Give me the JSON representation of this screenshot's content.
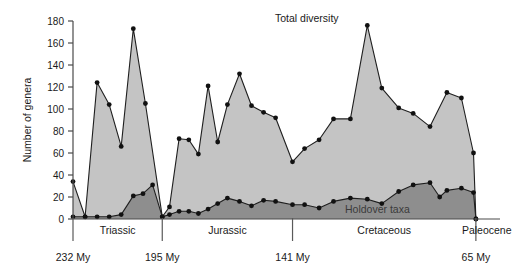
{
  "chart_data": {
    "type": "area",
    "title": "",
    "xlabel": "",
    "ylabel": "Number of genera",
    "ylim": [
      0,
      180
    ],
    "yticks": [
      0,
      20,
      40,
      60,
      80,
      100,
      120,
      140,
      160,
      180
    ],
    "grid": false,
    "legend_position": "inline-annotation",
    "xlim_my": [
      232,
      55
    ],
    "x_axis_unit": "My",
    "x_tick_labels": [
      "232 My",
      "195 My",
      "141 My",
      "65 My"
    ],
    "x_tick_values_my": [
      232,
      195,
      141,
      65
    ],
    "period_labels": [
      "Triassic",
      "Jurassic",
      "Cretaceous",
      "Paleocene"
    ],
    "annotations": [
      {
        "text": "Total diversity",
        "series": "Total diversity"
      },
      {
        "text": "Holdover taxa",
        "series": "Holdover taxa"
      }
    ],
    "series": [
      {
        "name": "Total diversity",
        "color": "#c4c4c4",
        "values": [
          34,
          2,
          124,
          104,
          66,
          173,
          105,
          2,
          11,
          73,
          72,
          59,
          121,
          70,
          104,
          132,
          103,
          97,
          92,
          52,
          64,
          72,
          91,
          91,
          176,
          119,
          101,
          96,
          84,
          115,
          110,
          60,
          0
        ],
        "x_my": [
          232,
          227,
          222,
          217,
          212,
          207,
          202,
          195,
          192,
          188,
          184,
          180,
          176,
          172,
          168,
          163,
          158,
          153,
          148,
          141,
          136,
          130,
          124,
          117,
          110,
          104,
          97,
          91,
          84,
          77,
          71,
          66,
          65
        ]
      },
      {
        "name": "Holdover taxa",
        "color": "#8e8e8e",
        "values": [
          2,
          2,
          2,
          2,
          4,
          21,
          23,
          31,
          2,
          4,
          7,
          7,
          5,
          9,
          14,
          19,
          16,
          12,
          17,
          16,
          13,
          13,
          10,
          16,
          19,
          18,
          14,
          25,
          31,
          33,
          20,
          26,
          28,
          24,
          0
        ],
        "x_my": [
          232,
          227,
          222,
          217,
          212,
          207,
          203,
          199,
          195,
          192,
          188,
          184,
          180,
          176,
          172,
          168,
          163,
          158,
          153,
          148,
          141,
          136,
          130,
          124,
          117,
          110,
          104,
          97,
          91,
          84,
          80,
          77,
          71,
          66,
          65
        ]
      }
    ]
  },
  "axis": {
    "y_title": "Number of genera",
    "y_ticks": [
      "0",
      "20",
      "40",
      "60",
      "80",
      "100",
      "120",
      "140",
      "160",
      "180"
    ],
    "x_ticks": [
      "232 My",
      "195 My",
      "141 My",
      "65 My"
    ]
  },
  "periods": {
    "triassic": "Triassic",
    "jurassic": "Jurassic",
    "cretaceous": "Cretaceous",
    "paleocene": "Paleocene"
  },
  "labels": {
    "total_diversity": "Total diversity",
    "holdover_taxa": "Holdover taxa"
  }
}
